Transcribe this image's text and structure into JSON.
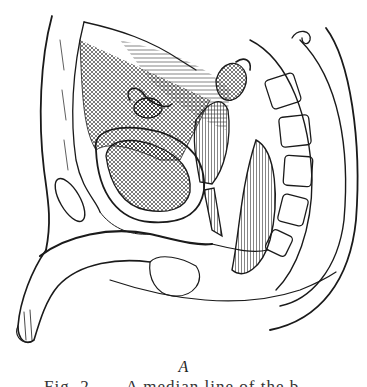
{
  "figure": {
    "style": "black-and-white engraving line drawing",
    "ink_color": "#1a1a1a",
    "paper_color": "#ffffff"
  },
  "panel_label": "A",
  "caption": {
    "text": "Fig. 2——A median line of the b",
    "clipped": true
  }
}
